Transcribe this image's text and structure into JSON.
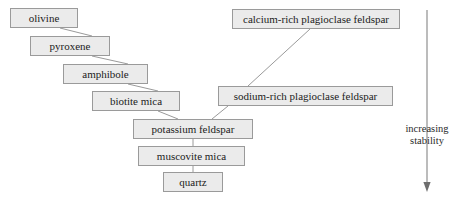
{
  "diagram": {
    "background_color": "#ffffff",
    "node_fill_color": "#ebebeb",
    "node_border_color": "#9a9a9a",
    "connector_color": "#9a9a9a",
    "text_color": "#1c1c1c"
  },
  "nodes": [
    {
      "id": "olivine",
      "label": "olivine",
      "x": 10,
      "y": 8,
      "w": 68,
      "h": 20
    },
    {
      "id": "pyroxene",
      "label": "pyroxene",
      "x": 30,
      "y": 36,
      "w": 80,
      "h": 20
    },
    {
      "id": "amphibole",
      "label": "amphibole",
      "x": 63,
      "y": 64,
      "w": 85,
      "h": 20
    },
    {
      "id": "biotite-mica",
      "label": "biotite mica",
      "x": 92,
      "y": 91,
      "w": 88,
      "h": 20
    },
    {
      "id": "calcium-rich-plagioclase-feldspar",
      "label": "calcium-rich plagioclase feldspar",
      "x": 232,
      "y": 9,
      "w": 168,
      "h": 20
    },
    {
      "id": "sodium-rich-plagioclase-feldspar",
      "label": "sodium-rich plagioclase feldspar",
      "x": 218,
      "y": 86,
      "w": 175,
      "h": 20
    },
    {
      "id": "potassium-feldspar",
      "label": "potassium feldspar",
      "x": 133,
      "y": 119,
      "w": 120,
      "h": 20
    },
    {
      "id": "muscovite-mica",
      "label": "muscovite mica",
      "x": 138,
      "y": 146,
      "w": 107,
      "h": 20
    },
    {
      "id": "quartz",
      "label": "quartz",
      "x": 163,
      "y": 172,
      "w": 60,
      "h": 20
    }
  ],
  "connectors": [
    {
      "from": "olivine",
      "to": "pyroxene",
      "x1": 60,
      "y1": 28,
      "x2": 92,
      "y2": 36
    },
    {
      "from": "pyroxene",
      "to": "amphibole",
      "x1": 92,
      "y1": 56,
      "x2": 128,
      "y2": 64
    },
    {
      "from": "amphibole",
      "to": "biotite-mica",
      "x1": 128,
      "y1": 84,
      "x2": 158,
      "y2": 91
    },
    {
      "from": "biotite-mica",
      "to": "potassium-feldspar",
      "x1": 158,
      "y1": 111,
      "x2": 178,
      "y2": 119
    },
    {
      "from": "calcium-rich-plagioclase-feldspar",
      "to": "sodium-rich-plagioclase-feldspar",
      "x1": 310,
      "y1": 29,
      "x2": 248,
      "y2": 86
    },
    {
      "from": "sodium-rich-plagioclase-feldspar",
      "to": "potassium-feldspar",
      "x1": 228,
      "y1": 106,
      "x2": 212,
      "y2": 119
    },
    {
      "from": "potassium-feldspar",
      "to": "muscovite-mica",
      "x1": 193,
      "y1": 139,
      "x2": 193,
      "y2": 146
    },
    {
      "from": "muscovite-mica",
      "to": "quartz",
      "x1": 193,
      "y1": 166,
      "x2": 193,
      "y2": 172
    }
  ],
  "axis": {
    "label_line1": "increasing",
    "label_line2": "stability",
    "arrow_x": 427,
    "arrow_top": 10,
    "arrow_bottom": 192
  }
}
